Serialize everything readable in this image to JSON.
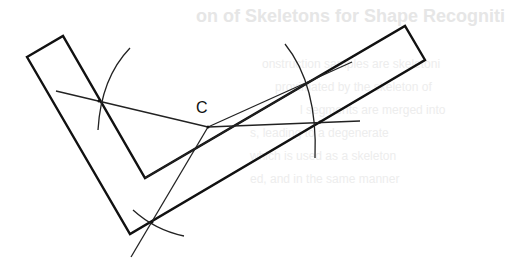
{
  "bleed_through": {
    "title": "on of Skeletons for Shape Recogniti",
    "lines": [
      "onstruction samples are skeletoni",
      "proximated by the skeleton of",
      "l segments are merged into",
      "s, leading to a degenerate",
      "which is used as a skeleton",
      "ed, and in the same manner"
    ]
  },
  "diagram": {
    "point_label": "C",
    "stroke_color": "#111111",
    "background": "#ffffff",
    "shape": {
      "type": "L-shaped polygon",
      "outer": [
        [
          27,
          57
        ],
        [
          63,
          36
        ],
        [
          145,
          178
        ],
        [
          405,
          26
        ],
        [
          425,
          60
        ],
        [
          130,
          234
        ]
      ],
      "inner_corner": [
        145,
        178
      ]
    },
    "construction": {
      "arcs": 4,
      "lines": 3,
      "intersection_points": 4
    }
  }
}
